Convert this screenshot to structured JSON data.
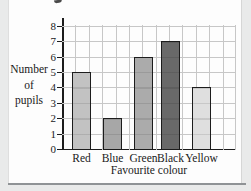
{
  "chart_data": {
    "type": "bar",
    "title": "",
    "categories": [
      "Red",
      "Blue",
      "Green",
      "Black",
      "Yellow"
    ],
    "values": [
      5,
      2,
      6,
      7,
      4
    ],
    "bar_colors": [
      "#c2c2c2",
      "#a7a7a7",
      "#ababab",
      "#696969",
      "#dfdfdf"
    ],
    "xlabel": "Favourite colour",
    "ylabel": "Number of pupils",
    "ylabel_lines": [
      "Number",
      "of",
      "pupils"
    ],
    "ylim": [
      0,
      8
    ],
    "yticks": [
      0,
      1,
      2,
      3,
      4,
      5,
      6,
      7,
      8
    ],
    "grid": true,
    "legend_position": "none"
  },
  "colors": {
    "grid": "#c7c7c7",
    "axis": "#1c1c1c",
    "bar_border": "#1c1c1c",
    "panel_background": "#fdfdfd",
    "outer_background": "#e9eaea",
    "bottom_rule": "#8f9396",
    "text": "#1a1a1a"
  }
}
